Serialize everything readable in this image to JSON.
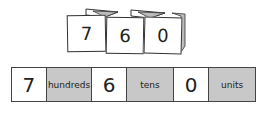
{
  "flip_cards": [
    {
      "digit": "7"
    },
    {
      "digit": "6"
    },
    {
      "digit": "0"
    }
  ],
  "place_value_strip": [
    {
      "type": "digit",
      "value": "7"
    },
    {
      "type": "label",
      "value": "hundreds"
    },
    {
      "type": "digit",
      "value": "6"
    },
    {
      "type": "label",
      "value": "tens"
    },
    {
      "type": "digit",
      "value": "0"
    },
    {
      "type": "label",
      "value": "units"
    }
  ],
  "colors": {
    "label_fill": "#c8c8c8",
    "digit_fill": "#ffffff",
    "border": "#444444"
  }
}
